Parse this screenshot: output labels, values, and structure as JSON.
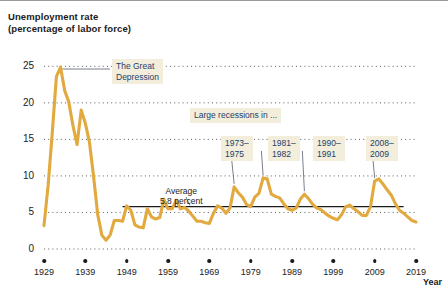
{
  "chart_data": {
    "type": "line",
    "title": "Unemployment rate",
    "subtitle": "(percentage of labor force)",
    "xlabel": "Year",
    "ylabel": "",
    "xlim": [
      1929,
      2019
    ],
    "ylim": [
      0,
      26
    ],
    "grid": "dotted-horizontal",
    "legend": "none",
    "line_color": "#e2a93f",
    "average_line_color": "#1b1b1b",
    "callout_bg": "#f3eedb",
    "callout_text_color": "#20365c",
    "average_value": 5.8,
    "y_ticks": [
      0,
      5,
      10,
      15,
      20,
      25
    ],
    "x_ticks": [
      1929,
      1939,
      1949,
      1959,
      1969,
      1979,
      1989,
      1999,
      2009,
      2019
    ],
    "x": [
      1929,
      1930,
      1931,
      1932,
      1933,
      1934,
      1935,
      1936,
      1937,
      1938,
      1939,
      1940,
      1941,
      1942,
      1943,
      1944,
      1945,
      1946,
      1947,
      1948,
      1949,
      1950,
      1951,
      1952,
      1953,
      1954,
      1955,
      1956,
      1957,
      1958,
      1959,
      1960,
      1961,
      1962,
      1963,
      1964,
      1965,
      1966,
      1967,
      1968,
      1969,
      1970,
      1971,
      1972,
      1973,
      1974,
      1975,
      1976,
      1977,
      1978,
      1979,
      1980,
      1981,
      1982,
      1983,
      1984,
      1985,
      1986,
      1987,
      1988,
      1989,
      1990,
      1991,
      1992,
      1993,
      1994,
      1995,
      1996,
      1997,
      1998,
      1999,
      2000,
      2001,
      2002,
      2003,
      2004,
      2005,
      2006,
      2007,
      2008,
      2009,
      2010,
      2011,
      2012,
      2013,
      2014,
      2015,
      2016,
      2017,
      2018,
      2019
    ],
    "values": [
      3.2,
      8.7,
      15.9,
      23.6,
      24.9,
      21.7,
      20.1,
      16.9,
      14.3,
      19.0,
      17.2,
      14.6,
      9.9,
      4.7,
      1.9,
      1.2,
      1.9,
      3.9,
      3.9,
      3.8,
      5.9,
      5.3,
      3.3,
      3.0,
      2.9,
      5.5,
      4.4,
      4.1,
      4.3,
      6.8,
      5.5,
      5.5,
      6.7,
      5.5,
      5.7,
      5.2,
      4.5,
      3.8,
      3.8,
      3.6,
      3.5,
      4.9,
      5.9,
      5.6,
      4.9,
      5.6,
      8.5,
      7.7,
      7.1,
      6.1,
      5.8,
      7.1,
      7.6,
      9.7,
      9.6,
      7.5,
      7.2,
      7.0,
      6.2,
      5.5,
      5.3,
      5.6,
      6.8,
      7.5,
      6.9,
      6.1,
      5.6,
      5.4,
      4.9,
      4.5,
      4.2,
      4.0,
      4.7,
      5.8,
      6.0,
      5.5,
      5.1,
      4.6,
      4.6,
      5.8,
      9.3,
      9.6,
      8.9,
      8.1,
      7.4,
      6.2,
      5.3,
      4.9,
      4.4,
      3.9,
      3.7
    ],
    "annotations": [
      {
        "name": "great-depression",
        "text": "The Great Depression",
        "lines": [
          "The Great",
          "Depression"
        ],
        "points_to_year": 1933
      },
      {
        "name": "large-recessions-header",
        "text": "Large recessions in ...",
        "lines": [
          "Large recessions in ..."
        ]
      },
      {
        "name": "recession-1973-1975",
        "text": "1973–1975",
        "lines": [
          "1973–",
          "1975"
        ],
        "points_to_year": 1975
      },
      {
        "name": "recession-1981-1982",
        "text": "1981–1982",
        "lines": [
          "1981–",
          "1982"
        ],
        "points_to_year": 1982
      },
      {
        "name": "recession-1990-1991",
        "text": "1990–1991",
        "lines": [
          "1990–",
          "1991"
        ],
        "points_to_year": 1992
      },
      {
        "name": "recession-2008-2009",
        "text": "2008–2009",
        "lines": [
          "2008–",
          "2009"
        ],
        "points_to_year": 2009
      },
      {
        "name": "average-label",
        "text": "Average 5.8 percent",
        "lines": [
          "Average",
          "5.8 percent"
        ]
      }
    ]
  },
  "labels": {
    "title_line1": "Unemployment rate",
    "title_line2": "(percentage of labor force)",
    "x_axis_name": "Year",
    "great_depression_l1": "The Great",
    "great_depression_l2": "Depression",
    "large_recessions": "Large recessions in ...",
    "r1_l1": "1973–",
    "r1_l2": "1975",
    "r2_l1": "1981–",
    "r2_l2": "1982",
    "r3_l1": "1990–",
    "r3_l2": "1991",
    "r4_l1": "2008–",
    "r4_l2": "2009",
    "avg_l1": "Average",
    "avg_l2": "5.8 percent"
  }
}
